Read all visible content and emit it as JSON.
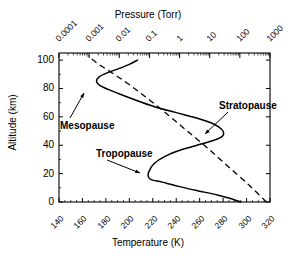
{
  "chart_data": {
    "type": "line",
    "title": "",
    "xlabel": "Temperature (K)",
    "ylabel": "Altitude (km)",
    "secondary_xlabel": "Pressure (Torr)",
    "xlim": [
      140,
      320
    ],
    "ylim": [
      0,
      105
    ],
    "xticks": [
      140,
      160,
      180,
      200,
      220,
      240,
      260,
      280,
      300,
      320
    ],
    "yticks": [
      0,
      20,
      40,
      60,
      80,
      100
    ],
    "secondary_xticks": [
      0.0001,
      0.001,
      0.01,
      0.1,
      1,
      10,
      100,
      1000
    ],
    "secondary_xtick_labels": [
      "0.0001",
      "0.001",
      "0.01",
      "0.1",
      "1",
      "10",
      "100",
      "1000"
    ],
    "secondary_xscale": "log",
    "secondary_xlim": [
      0.0001,
      1000
    ],
    "grid": false,
    "legend": "none",
    "series": [
      {
        "name": "Temperature profile",
        "style": "solid",
        "color": "#000000",
        "x_label": "Temperature (K)",
        "y_label": "Altitude (km)",
        "points": [
          {
            "t": 295,
            "z": 0
          },
          {
            "t": 288,
            "z": 2
          },
          {
            "t": 275,
            "z": 5
          },
          {
            "t": 258,
            "z": 8
          },
          {
            "t": 242,
            "z": 11
          },
          {
            "t": 228,
            "z": 14
          },
          {
            "t": 218,
            "z": 16
          },
          {
            "t": 216,
            "z": 19
          },
          {
            "t": 217,
            "z": 22
          },
          {
            "t": 221,
            "z": 27
          },
          {
            "t": 230,
            "z": 32
          },
          {
            "t": 245,
            "z": 37
          },
          {
            "t": 262,
            "z": 41
          },
          {
            "t": 274,
            "z": 44
          },
          {
            "t": 280,
            "z": 47
          },
          {
            "t": 279,
            "z": 51
          },
          {
            "t": 272,
            "z": 55
          },
          {
            "t": 258,
            "z": 59
          },
          {
            "t": 240,
            "z": 63
          },
          {
            "t": 222,
            "z": 67
          },
          {
            "t": 208,
            "z": 71
          },
          {
            "t": 195,
            "z": 75
          },
          {
            "t": 183,
            "z": 79
          },
          {
            "t": 175,
            "z": 82
          },
          {
            "t": 172,
            "z": 85
          },
          {
            "t": 174,
            "z": 88
          },
          {
            "t": 181,
            "z": 91
          },
          {
            "t": 191,
            "z": 94
          },
          {
            "t": 200,
            "z": 97
          },
          {
            "t": 207,
            "z": 100
          }
        ]
      },
      {
        "name": "Pressure profile",
        "style": "dashed",
        "color": "#000000",
        "x_label": "Pressure (Torr)",
        "y_label": "Altitude (km)",
        "points": [
          {
            "p": 760,
            "z": 0
          },
          {
            "p": 200,
            "z": 12
          },
          {
            "p": 41,
            "z": 25
          },
          {
            "p": 8.5,
            "z": 38
          },
          {
            "p": 1.8,
            "z": 50
          },
          {
            "p": 0.38,
            "z": 62
          },
          {
            "p": 0.075,
            "z": 74
          },
          {
            "p": 0.013,
            "z": 86
          },
          {
            "p": 0.0021,
            "z": 97
          },
          {
            "p": 0.0009,
            "z": 103
          }
        ]
      }
    ],
    "annotations": [
      {
        "label": "Mesopause",
        "target_t": 172,
        "target_z": 85,
        "note": "arrow points up-right to temperature minimum"
      },
      {
        "label": "Stratopause",
        "target_t": 280,
        "target_z": 47,
        "note": "arrow points down-left to temperature maximum"
      },
      {
        "label": "Tropopause",
        "target_t": 217,
        "target_z": 17,
        "note": "arrow points down-right to lower temperature minimum"
      }
    ]
  },
  "axes": {
    "top_title": "Pressure (Torr)",
    "bottom_title": "Temperature (K)",
    "left_title": "Altitude (km)"
  },
  "labels": {
    "mesopause": "Mesopause",
    "stratopause": "Stratopause",
    "tropopause": "Tropopause"
  }
}
